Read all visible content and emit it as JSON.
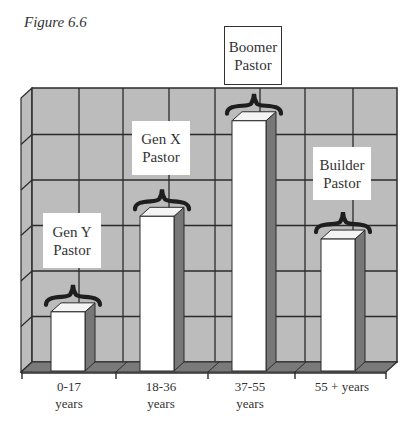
{
  "figure_title": "Figure 6.6",
  "colors": {
    "wall": "#bcbcbc",
    "floor": "#7a7a7a",
    "bar_front": "#ffffff",
    "bar_side": "#777777",
    "grid": "#2b2b2b",
    "brace": "#1e1e1e"
  },
  "chart_data": {
    "type": "bar",
    "title": "Figure 6.6",
    "style": "3d",
    "categories": [
      "0-17 years",
      "18-36 years",
      "37-55 years",
      "55 + years"
    ],
    "values": [
      1.3,
      3.4,
      5.5,
      2.9
    ],
    "annotations": [
      "Gen Y Pastor",
      "Gen X Pastor",
      "Boomer Pastor",
      "Builder Pastor"
    ],
    "xlabel": "",
    "ylabel": "",
    "ylim": [
      0,
      6
    ],
    "grid": true,
    "legend": "none",
    "y_tick_labels": "none"
  },
  "x_labels": [
    {
      "line1": "0-17",
      "line2": "years"
    },
    {
      "line1": "18-36",
      "line2": "years"
    },
    {
      "line1": "37-55",
      "line2": "years"
    },
    {
      "line1": "55 + years",
      "line2": ""
    }
  ],
  "bar_labels": [
    {
      "line1": "Gen Y",
      "line2": "Pastor"
    },
    {
      "line1": "Gen X",
      "line2": "Pastor"
    },
    {
      "line1": "Boomer",
      "line2": "Pastor"
    },
    {
      "line1": "Builder",
      "line2": "Pastor"
    }
  ]
}
